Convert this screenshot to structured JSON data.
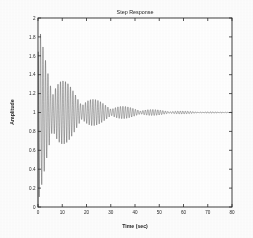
{
  "figure": {
    "background_color": "#fdfdfd",
    "plot_background_color": "#ffffff",
    "axis_color": "#2b2b2b",
    "curve_color": "#1a1a1a"
  },
  "chart_data": {
    "type": "line",
    "title": "Step Response",
    "xlabel": "Time (sec)",
    "ylabel": "Amplitude",
    "xlim": [
      0,
      80
    ],
    "ylim": [
      0,
      2
    ],
    "xticks": [
      0,
      10,
      20,
      30,
      40,
      50,
      60,
      70,
      80
    ],
    "xticklabels": [
      "0",
      "10",
      "20",
      "30",
      "40",
      "50",
      "60",
      "70",
      "80"
    ],
    "yticks": [
      0,
      0.2,
      0.4,
      0.6,
      0.8,
      1,
      1.2,
      1.4,
      1.6,
      1.8,
      2
    ],
    "yticklabels": [
      "0",
      "0.2",
      "0.4",
      "0.6",
      "0.8",
      "1",
      "1.2",
      "1.4",
      "1.6",
      "1.8",
      "2"
    ],
    "grid": false,
    "legend": null,
    "steady_state_value": 1.0,
    "series": [
      {
        "name": "Step Response",
        "color": "#1a1a1a",
        "model": {
          "kind": "beating-damped-oscillation",
          "offset": 1.0,
          "carrier_frequency_rad_s": 6.1,
          "beat_frequency_rad_s": 0.52,
          "decay_time_constant_s": 17.0,
          "initial_envelope": 0.95,
          "start_value": 0.0,
          "samples": 3600
        },
        "envelope_peaks": [
          {
            "t": 0.0,
            "max": 1.7,
            "min": 0.05
          },
          {
            "t": 2.5,
            "max": 1.88,
            "min": 0.14
          },
          {
            "t": 6.0,
            "max": 1.56,
            "min": 0.28
          },
          {
            "t": 10.5,
            "max": 1.62,
            "min": 0.4
          },
          {
            "t": 14.0,
            "max": 1.34,
            "min": 0.62
          },
          {
            "t": 18.0,
            "max": 1.46,
            "min": 0.54
          },
          {
            "t": 24.5,
            "max": 1.3,
            "min": 0.7
          },
          {
            "t": 32.0,
            "max": 1.22,
            "min": 0.78
          },
          {
            "t": 40.0,
            "max": 1.16,
            "min": 0.84
          },
          {
            "t": 48.0,
            "max": 1.1,
            "min": 0.9
          },
          {
            "t": 56.0,
            "max": 1.06,
            "min": 0.94
          },
          {
            "t": 64.0,
            "max": 1.03,
            "min": 0.97
          },
          {
            "t": 72.0,
            "max": 1.01,
            "min": 0.99
          },
          {
            "t": 80.0,
            "max": 1.0,
            "min": 1.0
          }
        ]
      }
    ]
  }
}
